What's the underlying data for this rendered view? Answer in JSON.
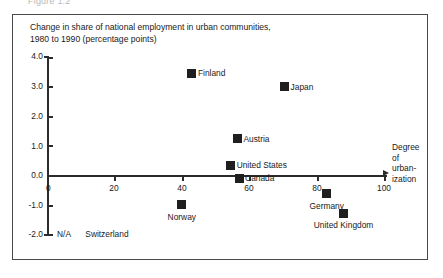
{
  "figure": {
    "clipped_header_text": "Figure 1.2",
    "title_line1": "Change in share of national employment in urban communities,",
    "title_line2": "1980 to 1990 (percentage points)",
    "na_note_label": "N/A",
    "na_note_country": "Switzerland"
  },
  "chart_data": {
    "type": "scatter",
    "title": "Change in share of national employment in urban communities, 1980 to 1990 (percentage points)",
    "xlabel": "Degree of urbanization",
    "ylabel": "Change in share of national employment in urban communities, 1980 to 1990 (percentage points)",
    "xlim": [
      0,
      100
    ],
    "ylim": [
      -2.0,
      4.0
    ],
    "xticks": [
      0,
      20,
      40,
      60,
      80,
      100
    ],
    "xtick_labels": [
      "0",
      "20",
      "40",
      "60",
      "80",
      "100"
    ],
    "yticks": [
      -2.0,
      -1.0,
      0.0,
      1.0,
      2.0,
      3.0,
      4.0
    ],
    "ytick_labels": [
      "-2.0",
      "-1.0",
      "0.0",
      "1.0",
      "2.0",
      "3.0",
      "4.0"
    ],
    "grid": false,
    "legend": "none",
    "marker": "filled-square",
    "marker_color": "#1f1f1f",
    "points": [
      {
        "label": "Finland",
        "x": 43,
        "y": 3.45,
        "label_pos": "right"
      },
      {
        "label": "Japan",
        "x": 70.5,
        "y": 3.0,
        "label_pos": "right"
      },
      {
        "label": "Austria",
        "x": 56.5,
        "y": 1.25,
        "label_pos": "right"
      },
      {
        "label": "United States",
        "x": 54.5,
        "y": 0.35,
        "label_pos": "right"
      },
      {
        "label": "Canada",
        "x": 57,
        "y": -0.1,
        "label_pos": "right"
      },
      {
        "label": "Norway",
        "x": 40,
        "y": -0.98,
        "label_pos": "below"
      },
      {
        "label": "Germany",
        "x": 83,
        "y": -0.62,
        "label_pos": "below"
      },
      {
        "label": "United Kingdom",
        "x": 88,
        "y": -1.27,
        "label_pos": "below"
      }
    ],
    "not_available": [
      "Switzerland"
    ]
  },
  "axis_caption": {
    "l1": "Degree",
    "l2": "of",
    "l3": "urban-",
    "l4": "ization"
  }
}
